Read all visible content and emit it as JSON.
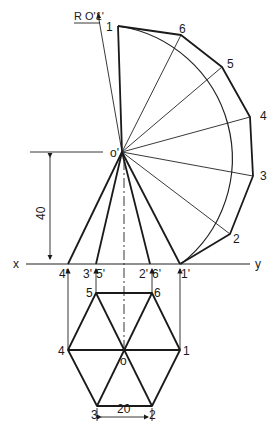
{
  "diagram": {
    "title_label": "R O'1'",
    "axis": {
      "x_label": "x",
      "y_label": "y"
    },
    "dimensions": {
      "height": "40",
      "side": "20"
    },
    "apex_label": "o'",
    "plan_center_label": "o",
    "front_view_labels": [
      "4'",
      "3'",
      "5'",
      "2'",
      "6'",
      "1'"
    ],
    "plan_labels": [
      "1",
      "2",
      "3",
      "4",
      "5",
      "6"
    ],
    "development_labels": [
      "1",
      "6",
      "5",
      "4",
      "3",
      "2"
    ],
    "colors": {
      "line": "#1a1a1a",
      "background": "#ffffff"
    }
  }
}
